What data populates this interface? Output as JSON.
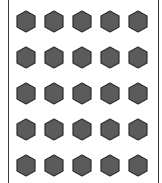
{
  "board": {
    "rows": 5,
    "columns": 5,
    "tile_shape": "hexagon-pointy-top",
    "tile_fill": "#5b5b5b",
    "tile_stroke": "#2e2e2e",
    "border_color": "#3a3a3a",
    "background": "#ffffff",
    "column_centers_x": [
      26,
      54,
      82,
      110,
      138
    ],
    "row_centers_y": [
      21,
      57,
      93,
      129,
      165
    ],
    "tiles": [
      {
        "row": 0,
        "col": 0,
        "state": "filled"
      },
      {
        "row": 0,
        "col": 1,
        "state": "filled"
      },
      {
        "row": 0,
        "col": 2,
        "state": "filled"
      },
      {
        "row": 0,
        "col": 3,
        "state": "filled"
      },
      {
        "row": 0,
        "col": 4,
        "state": "filled"
      },
      {
        "row": 1,
        "col": 0,
        "state": "filled"
      },
      {
        "row": 1,
        "col": 1,
        "state": "filled"
      },
      {
        "row": 1,
        "col": 2,
        "state": "filled"
      },
      {
        "row": 1,
        "col": 3,
        "state": "filled"
      },
      {
        "row": 1,
        "col": 4,
        "state": "filled"
      },
      {
        "row": 2,
        "col": 0,
        "state": "filled"
      },
      {
        "row": 2,
        "col": 1,
        "state": "filled"
      },
      {
        "row": 2,
        "col": 2,
        "state": "filled"
      },
      {
        "row": 2,
        "col": 3,
        "state": "filled"
      },
      {
        "row": 2,
        "col": 4,
        "state": "filled"
      },
      {
        "row": 3,
        "col": 0,
        "state": "filled"
      },
      {
        "row": 3,
        "col": 1,
        "state": "filled"
      },
      {
        "row": 3,
        "col": 2,
        "state": "filled"
      },
      {
        "row": 3,
        "col": 3,
        "state": "filled"
      },
      {
        "row": 3,
        "col": 4,
        "state": "filled"
      },
      {
        "row": 4,
        "col": 0,
        "state": "filled"
      },
      {
        "row": 4,
        "col": 1,
        "state": "filled"
      },
      {
        "row": 4,
        "col": 2,
        "state": "filled"
      },
      {
        "row": 4,
        "col": 3,
        "state": "filled"
      },
      {
        "row": 4,
        "col": 4,
        "state": "filled"
      }
    ]
  }
}
